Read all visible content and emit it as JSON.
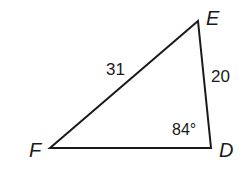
{
  "diagram": {
    "type": "triangle",
    "vertices": [
      {
        "name": "E",
        "x": 198,
        "y": 21
      },
      {
        "name": "D",
        "x": 211,
        "y": 148
      },
      {
        "name": "F",
        "x": 50,
        "y": 148
      }
    ],
    "sides": [
      {
        "between": "F-E",
        "label": "31"
      },
      {
        "between": "E-D",
        "label": "20"
      }
    ],
    "angles": [
      {
        "at": "D",
        "label": "84°"
      }
    ],
    "labels": {
      "E": "E",
      "D": "D",
      "F": "F",
      "side_FE": "31",
      "side_ED": "20",
      "angle_D": "84°"
    },
    "colors": {
      "stroke": "#1a1a1a",
      "background": "#ffffff"
    }
  }
}
